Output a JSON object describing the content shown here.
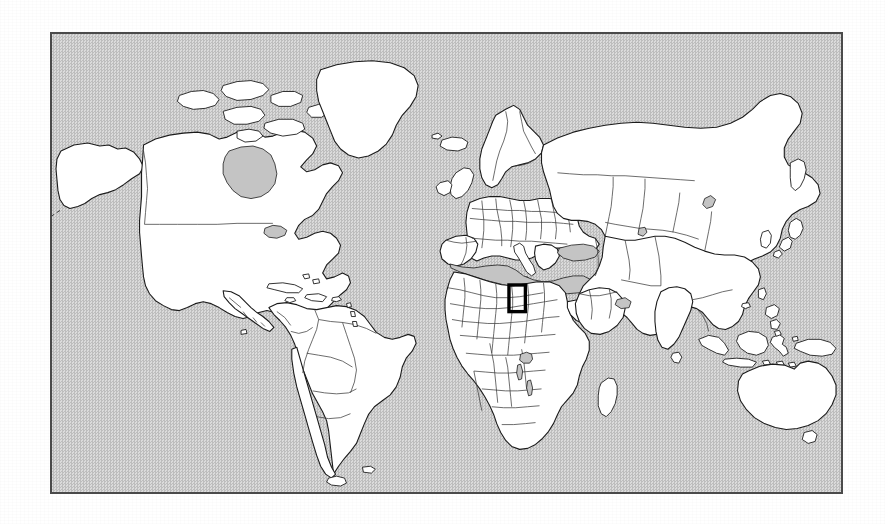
{
  "figure": {
    "kind": "world-locator-map",
    "caption": "",
    "frame": {
      "border_color": "#4a4a4a",
      "left": 50,
      "top": 32,
      "width": 793,
      "height": 462
    }
  },
  "map": {
    "projection": "equirectangular",
    "ocean_color": "#cfcfcf",
    "ocean_fill_style": "dithered-halftone-gray",
    "land_color": "#ffffff",
    "outline_color": "#1b1b1b",
    "border_color": "#3a3a3a",
    "lon_range": [
      -180,
      180
    ],
    "lat_range": [
      -62,
      84
    ],
    "graticule": "none",
    "labels": []
  },
  "highlight": {
    "shown": true,
    "shape": "rectangle",
    "stroke_color": "#000000",
    "stroke_width": 3.4,
    "region_name": "East African Great Lakes",
    "lon_range": [
      28.5,
      36.0
    ],
    "lat_range": [
      -4.5,
      4.0
    ],
    "pixel_box": {
      "x": 505,
      "y": 323,
      "width": 21,
      "height": 25
    }
  },
  "chart_data": {
    "type": "map",
    "title": "",
    "xlabel": "",
    "ylabel": "",
    "features": [
      {
        "name": "North America",
        "type": "landmass"
      },
      {
        "name": "Greenland",
        "type": "landmass"
      },
      {
        "name": "Iceland",
        "type": "island"
      },
      {
        "name": "South America",
        "type": "landmass"
      },
      {
        "name": "Europe",
        "type": "landmass"
      },
      {
        "name": "Africa",
        "type": "landmass"
      },
      {
        "name": "Asia",
        "type": "landmass"
      },
      {
        "name": "Indonesia",
        "type": "archipelago"
      },
      {
        "name": "Australia",
        "type": "landmass"
      },
      {
        "name": "New Zealand",
        "type": "island"
      },
      {
        "name": "Japan",
        "type": "archipelago"
      },
      {
        "name": "Madagascar",
        "type": "island"
      },
      {
        "name": "British Isles",
        "type": "island"
      },
      {
        "name": "Caribbean",
        "type": "archipelago"
      },
      {
        "name": "Philippines",
        "type": "archipelago"
      },
      {
        "name": "Sri Lanka",
        "type": "island"
      },
      {
        "name": "Mediterranean Sea",
        "type": "sea"
      },
      {
        "name": "Black Sea",
        "type": "sea"
      },
      {
        "name": "Caspian Sea",
        "type": "sea"
      },
      {
        "name": "Hudson Bay",
        "type": "sea"
      },
      {
        "name": "Lake Victoria",
        "type": "lake"
      }
    ],
    "annotations": [
      {
        "label": "",
        "kind": "inset-locator-rectangle",
        "lon_range": [
          28.5,
          36.0
        ],
        "lat_range": [
          -4.5,
          4.0
        ]
      }
    ]
  }
}
